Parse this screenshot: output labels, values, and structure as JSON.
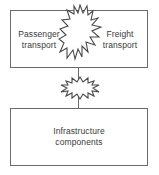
{
  "diagram": {
    "background_color": "#ffffff",
    "box_border_color": "#6b6b6b",
    "text_color": "#3a3a3a",
    "burst_outline_color": "#4a4a4a",
    "burst_fill_color": "#ffffff",
    "nodes": [
      {
        "id": "passenger-transport",
        "label": "Passenger\ntransport",
        "position": "top-left"
      },
      {
        "id": "freight-transport",
        "label": "Freight\ntransport",
        "position": "top-right"
      },
      {
        "id": "infrastructure-components",
        "label": "Infrastructure\ncomponents",
        "position": "bottom"
      }
    ],
    "conflict_markers": [
      {
        "id": "burst-large",
        "between": [
          "passenger-transport",
          "freight-transport"
        ],
        "orientation": "vertical",
        "shape": "starburst"
      },
      {
        "id": "burst-small",
        "between": [
          "top-box",
          "infrastructure-components"
        ],
        "orientation": "horizontal",
        "shape": "starburst"
      }
    ],
    "connectors": [
      {
        "id": "connector-line",
        "from": "top-box",
        "to": "infrastructure-components",
        "style": "solid-vertical"
      }
    ]
  }
}
